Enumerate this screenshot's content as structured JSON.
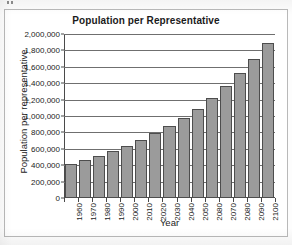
{
  "chart_data": {
    "type": "bar",
    "title": "Population per Representative",
    "xlabel": "Year",
    "ylabel": "Population per representative",
    "categories": [
      "1960",
      "1970",
      "1980",
      "1990",
      "2000",
      "2010",
      "2020",
      "2030",
      "2040",
      "2050",
      "2080",
      "2070",
      "2080",
      "2090",
      "2100"
    ],
    "values": [
      410000,
      460000,
      510000,
      575000,
      635000,
      705000,
      790000,
      875000,
      980000,
      1090000,
      1215000,
      1360000,
      1520000,
      1690000,
      1885000
    ],
    "ylim": [
      0,
      2000000
    ],
    "ytick_values": [
      0,
      200000,
      400000,
      600000,
      800000,
      1000000,
      1200000,
      1400000,
      1600000,
      1800000,
      2000000
    ],
    "ytick_labels": [
      "0",
      "200,000",
      "400,000",
      "600,000",
      "800,000",
      "1,000,000",
      "1,200,000",
      "1,400,000",
      "1,600,000",
      "1,800,000",
      "2,000,000"
    ],
    "grid": true,
    "grid_axis": "y",
    "legend": false,
    "bar_color": "#9b9b9b",
    "bar_edge_color": "#4d4d4d",
    "axis_color": "#4a4a4a",
    "gridline_color": "#6f6f6f",
    "title_color": "#1b1b1b",
    "plot_background": "#ffffff",
    "note": "X axis label at the 11th position reads 2080 (appears to be a typo in the source chart for 2060)"
  }
}
